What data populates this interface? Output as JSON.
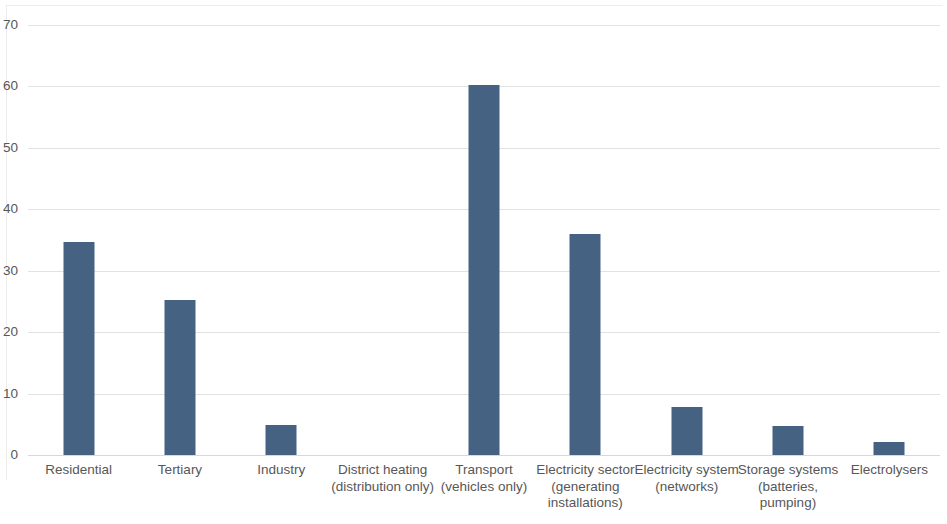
{
  "chart_data": {
    "type": "bar",
    "title": "",
    "subtitle": "",
    "xlabel": "",
    "ylabel": "",
    "ylim": [
      0,
      70
    ],
    "ytick_interval": 10,
    "yticks": [
      0,
      10,
      20,
      30,
      40,
      50,
      60,
      70
    ],
    "ytick_labels": [
      "0",
      "10",
      "20",
      "30",
      "40",
      "50",
      "60",
      "70"
    ],
    "grid": "horizontal",
    "legend": "none",
    "bar_color": "#456283",
    "gridline_color": "#e2e2e2",
    "axis_text_color": "#575757",
    "background": "#ffffff",
    "categories": [
      "Residential",
      "Tertiary",
      "Industry",
      "District heating (distribution only)",
      "Transport (vehicles only)",
      "Electricity sector (generating installations)",
      "Electricity system (networks)",
      "Storage systems (batteries, pumping)",
      "Electrolysers"
    ],
    "category_label_lines": [
      [
        "Residential"
      ],
      [
        "Tertiary"
      ],
      [
        "Industry"
      ],
      [
        "District heating",
        "(distribution only)"
      ],
      [
        "Transport",
        "(vehicles only)"
      ],
      [
        "Electricity sector",
        "(generating",
        "installations)"
      ],
      [
        "Electricity system",
        "(networks)"
      ],
      [
        "Storage systems",
        "(batteries,",
        "pumping)"
      ],
      [
        "Electrolysers"
      ]
    ],
    "values": [
      34.7,
      25.2,
      4.9,
      0,
      60.3,
      35.9,
      7.8,
      4.7,
      2.2
    ]
  }
}
